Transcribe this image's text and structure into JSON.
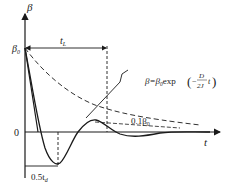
{
  "diagram": {
    "axes": {
      "y_label": "β",
      "x_label": "t",
      "origin_label": "0",
      "y0_label": "β",
      "y0_sub": "0"
    },
    "annotations": {
      "tL_label": "t",
      "tL_sub": "L",
      "half_td_label": "0.5t",
      "half_td_sub": "d",
      "threshold_label": "0.1β",
      "threshold_sub": "0",
      "envelope_formula_lhs": "β=β",
      "envelope_formula_sub": "0",
      "envelope_formula_exp": "exp",
      "envelope_formula_num": "D",
      "envelope_formula_den": "2J",
      "envelope_formula_var": "t",
      "envelope_formula_minus": "−"
    },
    "colors": {
      "line": "#1a1a1a",
      "background": "#ffffff"
    }
  }
}
